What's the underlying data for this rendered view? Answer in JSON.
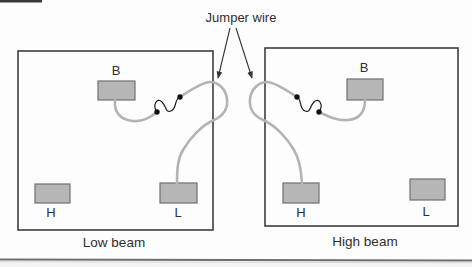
{
  "figure": {
    "title": "Jumper wire",
    "panels": [
      {
        "caption": "Low beam",
        "terminals": {
          "b": "B",
          "h": "H",
          "l": "L"
        }
      },
      {
        "caption": "High beam",
        "terminals": {
          "b": "B",
          "h": "H",
          "l": "L"
        }
      }
    ],
    "colors": {
      "background": "#fdfdfd",
      "box_border": "#3d3d3d",
      "terminal_fill": "#b6b6b6",
      "terminal_border": "#707070",
      "wire": "#b3b3b3",
      "coil": "#1c1c1c",
      "connection_dot": "#111111",
      "text": "#2f2f2f",
      "arrow": "#333333",
      "separator": "#6e6e6e"
    }
  }
}
